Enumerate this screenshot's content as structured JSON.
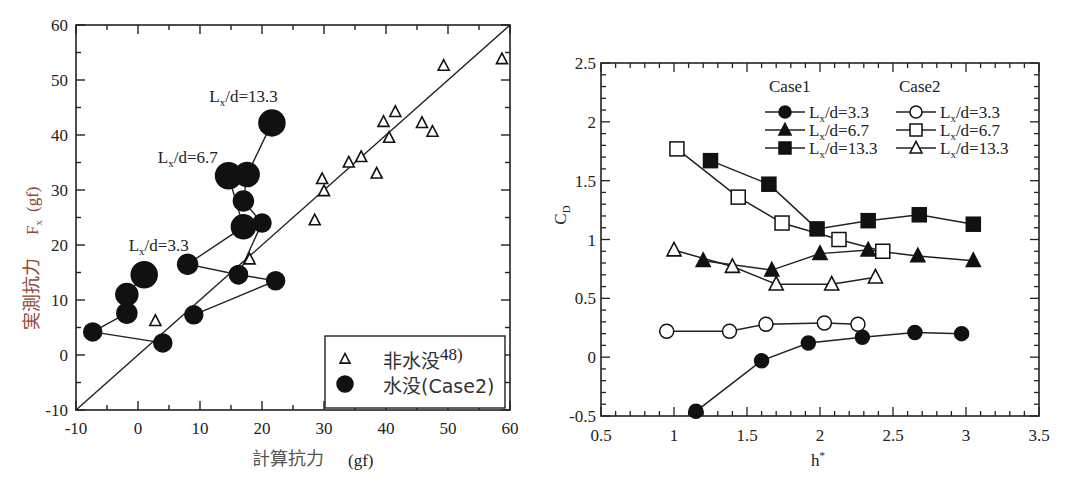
{
  "chart_data": [
    {
      "type": "scatter",
      "title": "",
      "xlabel": "計算抗力 (gf)",
      "ylabel": "実測抗力 Fx (gf)",
      "xlabel_jp": "計算抗力",
      "xlabel_unit": "(gf)",
      "ylabel_jp": "実測抗力",
      "ylabel_sym": "Fx",
      "ylabel_unit": "(gf)",
      "xlim": [
        -10,
        60
      ],
      "ylim": [
        -10,
        60
      ],
      "xticks": [
        "-10",
        "0",
        "10",
        "20",
        "30",
        "40",
        "50",
        "60"
      ],
      "yticks": [
        "-10",
        "0",
        "10",
        "20",
        "30",
        "40",
        "50",
        "60"
      ],
      "reference_line": {
        "label": "y = x",
        "from": [
          -10,
          -10
        ],
        "to": [
          60,
          60
        ]
      },
      "annotations": [
        {
          "text": "Lx/d=3.3",
          "x": -1.5,
          "y": 19
        },
        {
          "text": "Lx/d=6.7",
          "x": 3.2,
          "y": 35
        },
        {
          "text": "Lx/d=13.3",
          "x": 11.5,
          "y": 46
        }
      ],
      "legend": [
        {
          "marker": "open-triangle",
          "label": "非水没48)"
        },
        {
          "marker": "filled-circle",
          "label": "水没(Case2)"
        }
      ],
      "series": [
        {
          "name": "非水没48)",
          "marker": "open-triangle",
          "points": [
            [
              2.8,
              6.2
            ],
            [
              18,
              17.4
            ],
            [
              28.5,
              24.5
            ],
            [
              29.7,
              32
            ],
            [
              30,
              29.8
            ],
            [
              34,
              35
            ],
            [
              36,
              36
            ],
            [
              38.5,
              33
            ],
            [
              39.6,
              42.4
            ],
            [
              40.5,
              39.5
            ],
            [
              41.5,
              44.2
            ],
            [
              45.8,
              42.2
            ],
            [
              47.5,
              40.6
            ],
            [
              49.3,
              52.6
            ],
            [
              58.7,
              53.8
            ]
          ]
        },
        {
          "name": "水没(Case2) Lx/d=3.3",
          "marker": "filled-circle",
          "points": [
            [
              1,
              14.6
            ],
            [
              -1.8,
              11
            ],
            [
              -1.8,
              7.6
            ],
            [
              -7.3,
              4.2
            ],
            [
              4,
              2.2
            ]
          ],
          "sizes": [
            13,
            11,
            10,
            9,
            9
          ]
        },
        {
          "name": "水没(Case2) Lx/d=6.7",
          "marker": "filled-circle",
          "points": [
            [
              14.6,
              32.6
            ],
            [
              17,
              23.3
            ],
            [
              8,
              16.5
            ],
            [
              16.2,
              14.6
            ],
            [
              22.2,
              13.5
            ],
            [
              9,
              7.3
            ]
          ],
          "sizes": [
            13,
            12,
            10,
            9,
            9,
            9
          ]
        },
        {
          "name": "水没(Case2) Lx/d=13.3",
          "marker": "filled-circle",
          "points": [
            [
              21.6,
              42.2
            ],
            [
              17.6,
              32.8
            ],
            [
              17,
              28
            ],
            [
              20,
              24
            ],
            [
              16.2,
              14.6
            ]
          ],
          "sizes": [
            13,
            12,
            10,
            9,
            9
          ]
        }
      ]
    },
    {
      "type": "line",
      "title": "",
      "xlabel": "h*",
      "ylabel": "CD",
      "xlim": [
        0.5,
        3.5
      ],
      "ylim": [
        -0.5,
        2.5
      ],
      "xticks": [
        "0.5",
        "1",
        "1.5",
        "2",
        "2.5",
        "3",
        "3.5"
      ],
      "yticks": [
        "-0.5",
        "0",
        "0.5",
        "1",
        "1.5",
        "2",
        "2.5"
      ],
      "legend": {
        "group1_title": "Case1",
        "group2_title": "Case2",
        "entries": [
          {
            "group": "Case1",
            "marker": "filled-circle",
            "label": "Lx/d=3.3"
          },
          {
            "group": "Case1",
            "marker": "filled-triangle",
            "label": "Lx/d=6.7"
          },
          {
            "group": "Case1",
            "marker": "filled-square",
            "label": "Lx/d=13.3"
          },
          {
            "group": "Case2",
            "marker": "open-circle",
            "label": "Lx/d=3.3"
          },
          {
            "group": "Case2",
            "marker": "open-square",
            "label": "Lx/d=6.7"
          },
          {
            "group": "Case2",
            "marker": "open-triangle",
            "label": "Lx/d=13.3"
          }
        ]
      },
      "series": [
        {
          "name": "Case1 Lx/d=3.3",
          "marker": "filled-circle",
          "x": [
            1.15,
            1.6,
            1.92,
            2.29,
            2.65,
            2.97
          ],
          "y": [
            -0.46,
            -0.03,
            0.12,
            0.17,
            0.21,
            0.2
          ]
        },
        {
          "name": "Case1 Lx/d=6.7",
          "marker": "filled-triangle",
          "x": [
            1.2,
            1.67,
            2.0,
            2.33,
            2.67,
            3.05
          ],
          "y": [
            0.82,
            0.74,
            0.88,
            0.91,
            0.86,
            0.82
          ]
        },
        {
          "name": "Case1 Lx/d=13.3",
          "marker": "filled-square",
          "x": [
            1.25,
            1.65,
            1.98,
            2.33,
            2.68,
            3.05
          ],
          "y": [
            1.67,
            1.47,
            1.09,
            1.16,
            1.21,
            1.13
          ]
        },
        {
          "name": "Case2 Lx/d=3.3",
          "marker": "open-circle",
          "x": [
            0.95,
            1.38,
            1.63,
            2.03,
            2.26
          ],
          "y": [
            0.22,
            0.22,
            0.28,
            0.29,
            0.28
          ]
        },
        {
          "name": "Case2 Lx/d=6.7",
          "marker": "open-square",
          "x": [
            1.02,
            1.44,
            1.74,
            2.13,
            2.43
          ],
          "y": [
            1.77,
            1.36,
            1.14,
            1.0,
            0.9
          ]
        },
        {
          "name": "Case2 Lx/d=13.3",
          "marker": "open-triangle",
          "x": [
            1.0,
            1.4,
            1.7,
            2.08,
            2.38
          ],
          "y": [
            0.91,
            0.77,
            0.62,
            0.62,
            0.68
          ]
        }
      ]
    }
  ]
}
